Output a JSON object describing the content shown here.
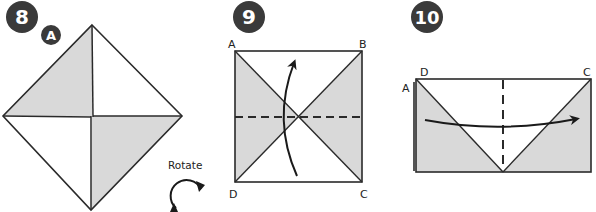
{
  "diagram": {
    "colors": {
      "badge": "#3a3a3a",
      "shade": "#d9d9d9",
      "line": "#2a2a2a",
      "background": "#ffffff"
    },
    "steps": [
      {
        "number": "8",
        "sub_badge": "A",
        "rotate_label": "Rotate",
        "description": "Diamond with two shaded triangles (upper-left and lower-right)"
      },
      {
        "number": "9",
        "corners": {
          "top_left": "A",
          "top_right": "B",
          "bottom_left": "D",
          "bottom_right": "C"
        },
        "description": "Square with diagonals, horizontal dashed fold line, upward curved arrow"
      },
      {
        "number": "10",
        "corners": {
          "left_outer": "A",
          "top_left": "D",
          "top_right": "C"
        },
        "description": "Rectangle with V crease, vertical dashed fold line, rightward curved arrow"
      }
    ]
  }
}
